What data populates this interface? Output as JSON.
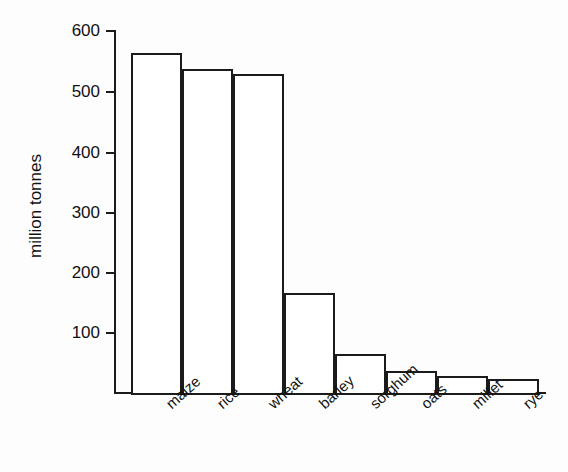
{
  "chart_data": {
    "type": "bar",
    "title": "",
    "xlabel": "",
    "ylabel": "million tonnes",
    "categories": [
      "maize",
      "rice",
      "wheat",
      "barley",
      "sorghum",
      "oats",
      "millet",
      "rye"
    ],
    "values": [
      562,
      535,
      527,
      165,
      65,
      37,
      28,
      23
    ],
    "ylim": [
      0,
      600
    ],
    "yticks": [
      600,
      500,
      400,
      300,
      200,
      100
    ],
    "ytick_labels": [
      "600",
      "500",
      "400",
      "300",
      "200",
      "100"
    ],
    "grid": false,
    "legend": null,
    "bar_facecolor": "#ffffff",
    "bar_edgecolor": "#1b1b1b",
    "axis_color": "#1b1b1b",
    "background": "#fdfdfd"
  }
}
